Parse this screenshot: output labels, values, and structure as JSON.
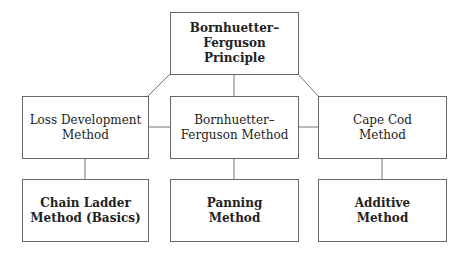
{
  "diagram": {
    "root": {
      "line1": "Bornhuetter–",
      "line2": "Ferguson Principle"
    },
    "methods": [
      {
        "line1": "Loss Development",
        "line2": "Method"
      },
      {
        "line1": "Bornhuetter–",
        "line2": "Ferguson Method"
      },
      {
        "line1": "Cape Cod",
        "line2": "Method"
      }
    ],
    "submethods": [
      {
        "line1": "Chain Ladder",
        "line2": "Method (Basics)"
      },
      {
        "line1": "Panning",
        "line2": "Method"
      },
      {
        "line1": "Additive",
        "line2": "Method"
      }
    ],
    "colors": {
      "border": "#666666",
      "text": "#222222",
      "background": "#ffffff"
    }
  }
}
